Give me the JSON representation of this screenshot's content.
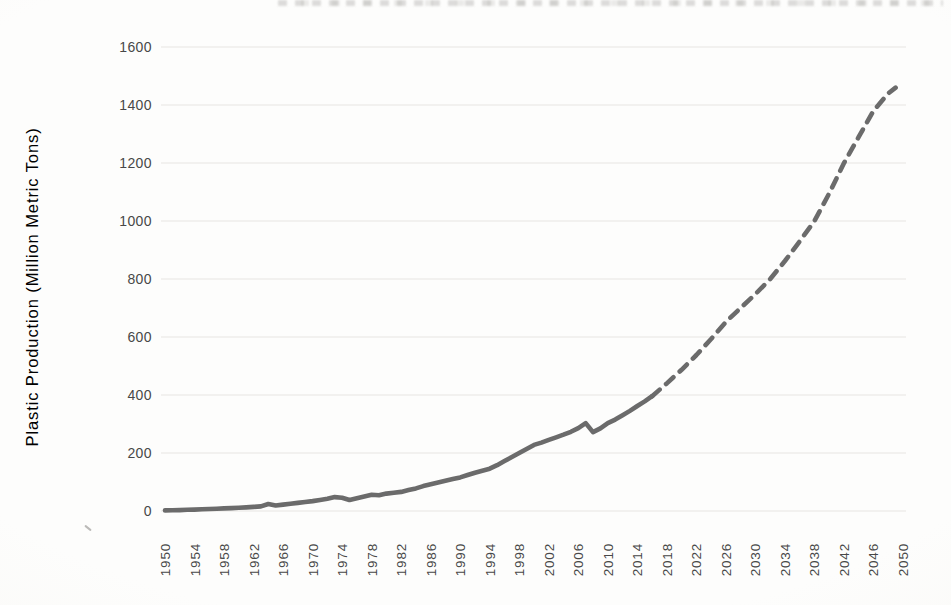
{
  "chart_data": {
    "type": "line",
    "title": "",
    "ylabel": "Plastic Production (Million Metric Tons)",
    "xlabel": "",
    "xlim": [
      1950,
      2050
    ],
    "ylim": [
      0,
      1600
    ],
    "x_ticks": [
      1950,
      1954,
      1958,
      1962,
      1966,
      1970,
      1974,
      1978,
      1982,
      1986,
      1990,
      1994,
      1998,
      2002,
      2006,
      2010,
      2014,
      2018,
      2022,
      2026,
      2030,
      2034,
      2038,
      2042,
      2046,
      2050
    ],
    "y_ticks": [
      0,
      200,
      400,
      600,
      800,
      1000,
      1200,
      1400,
      1600
    ],
    "grid": "horizontal",
    "legend": "none",
    "colors": {
      "line": "#6b6b6b",
      "gridline": "#e8e6e2",
      "tick_label": "#484848",
      "axis_title": "#3c3c3c",
      "background": "#fdfdfc"
    },
    "series": [
      {
        "name": "production-history",
        "style": "solid",
        "points": [
          [
            1950,
            2
          ],
          [
            1951,
            2.5
          ],
          [
            1952,
            3
          ],
          [
            1953,
            4
          ],
          [
            1954,
            5
          ],
          [
            1955,
            6
          ],
          [
            1956,
            7
          ],
          [
            1957,
            8
          ],
          [
            1958,
            9
          ],
          [
            1959,
            10
          ],
          [
            1960,
            11
          ],
          [
            1961,
            12.5
          ],
          [
            1962,
            14
          ],
          [
            1963,
            16
          ],
          [
            1964,
            24
          ],
          [
            1965,
            19
          ],
          [
            1966,
            22
          ],
          [
            1967,
            25
          ],
          [
            1968,
            28
          ],
          [
            1969,
            31
          ],
          [
            1970,
            34
          ],
          [
            1971,
            38
          ],
          [
            1972,
            42
          ],
          [
            1973,
            48
          ],
          [
            1974,
            46
          ],
          [
            1975,
            38
          ],
          [
            1976,
            44
          ],
          [
            1977,
            50
          ],
          [
            1978,
            56
          ],
          [
            1979,
            54
          ],
          [
            1980,
            60
          ],
          [
            1981,
            63
          ],
          [
            1982,
            66
          ],
          [
            1983,
            72
          ],
          [
            1984,
            78
          ],
          [
            1985,
            86
          ],
          [
            1986,
            92
          ],
          [
            1987,
            98
          ],
          [
            1988,
            104
          ],
          [
            1989,
            110
          ],
          [
            1990,
            116
          ],
          [
            1991,
            124
          ],
          [
            1992,
            132
          ],
          [
            1993,
            139
          ],
          [
            1994,
            146
          ],
          [
            1995,
            158
          ],
          [
            1996,
            172
          ],
          [
            1997,
            186
          ],
          [
            1998,
            200
          ],
          [
            1999,
            214
          ],
          [
            2000,
            228
          ],
          [
            2001,
            236
          ],
          [
            2002,
            245
          ],
          [
            2003,
            254
          ],
          [
            2004,
            263
          ],
          [
            2005,
            273
          ],
          [
            2006,
            286
          ],
          [
            2007,
            303
          ],
          [
            2008,
            272
          ],
          [
            2009,
            285
          ],
          [
            2010,
            303
          ],
          [
            2011,
            315
          ],
          [
            2012,
            330
          ],
          [
            2013,
            345
          ],
          [
            2014,
            362
          ],
          [
            2015,
            378
          ],
          [
            2016,
            396
          ]
        ]
      },
      {
        "name": "production-projection",
        "style": "dashed",
        "points": [
          [
            2016,
            396
          ],
          [
            2018,
            440
          ],
          [
            2020,
            487
          ],
          [
            2022,
            538
          ],
          [
            2024,
            593
          ],
          [
            2026,
            652
          ],
          [
            2028,
            700
          ],
          [
            2030,
            748
          ],
          [
            2032,
            800
          ],
          [
            2034,
            862
          ],
          [
            2036,
            930
          ],
          [
            2038,
            1000
          ],
          [
            2040,
            1095
          ],
          [
            2042,
            1200
          ],
          [
            2044,
            1290
          ],
          [
            2046,
            1380
          ],
          [
            2048,
            1440
          ],
          [
            2049,
            1460
          ]
        ]
      }
    ]
  }
}
